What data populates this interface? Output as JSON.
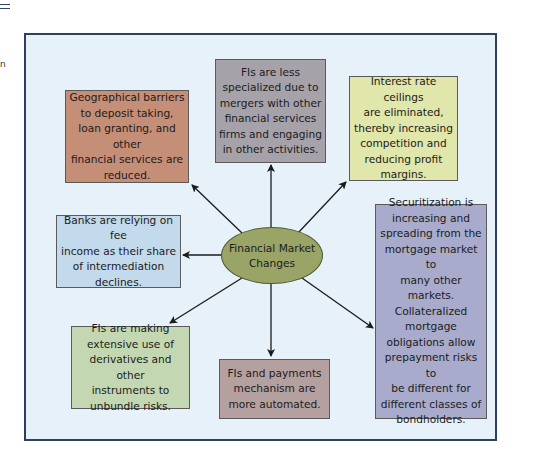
{
  "diagram": {
    "type": "hub-and-spoke",
    "center": {
      "label": "Financial Market\nChanges",
      "color": "#9ba467"
    },
    "nodes": [
      {
        "id": "geographic",
        "label": "Geographical barriers\nto deposit taking,\nloan granting, and other\nfinancial services are\nreduced.",
        "color": "#c58e76"
      },
      {
        "id": "less-specialized",
        "label": "FIs are less\nspecialized due to\nmergers with other\nfinancial services\nfirms and engaging\nin other activities.",
        "color": "#a6a2aa"
      },
      {
        "id": "rate-ceilings",
        "label": "Interest rate ceilings\nare eliminated,\nthereby increasing\ncompetition and\nreducing profit\nmargins.",
        "color": "#e1e6aa"
      },
      {
        "id": "fee-income",
        "label": "Banks are relying on fee\nincome as their share\nof intermediation\ndeclines.",
        "color": "#c3d9ec"
      },
      {
        "id": "securitization",
        "label": "Securitization is\nincreasing and\nspreading from the\nmortgage market to\nmany other\nmarkets.\nCollateralized\nmortgage\nobligations allow\nprepayment risks to\nbe different for\ndifferent classes of\nbondholders.",
        "color": "#a8abcc"
      },
      {
        "id": "derivatives",
        "label": "FIs are making\nextensive use of\nderivatives and other\ninstruments to\nunbundle risks.",
        "color": "#c3d8b2"
      },
      {
        "id": "payments",
        "label": "FIs and payments\nmechanism are\nmore automated.",
        "color": "#b5a0a0"
      }
    ],
    "frame_color": "#2f3f5e",
    "background_color": "#e7f1f9"
  },
  "side_text": "n"
}
